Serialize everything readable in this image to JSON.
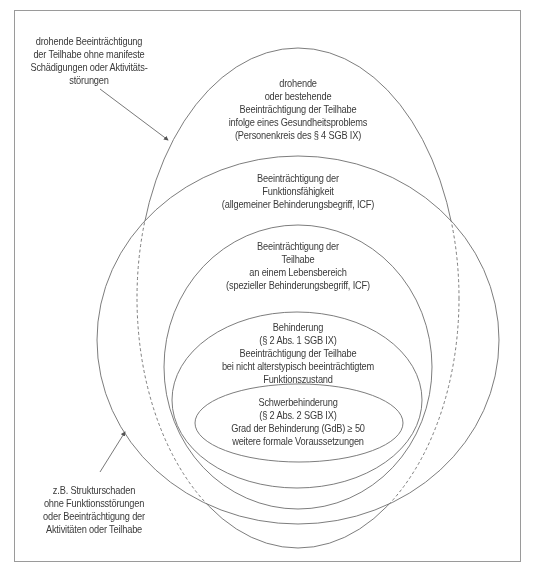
{
  "diagram": {
    "type": "nested-ellipses",
    "colors": {
      "line": "#6e6e6e",
      "text": "#3a3a3a",
      "frame": "#9a9a9a",
      "background": "#ffffff"
    }
  },
  "annotations": {
    "top_left": {
      "lines": [
        "drohende Beeinträchtigung",
        "der Teilhabe ohne manifeste",
        "Schädigungen oder Aktivitäts-",
        "störungen"
      ]
    },
    "bottom_left": {
      "lines": [
        "z.B. Strukturschaden",
        "ohne Funktionsstörungen",
        "oder Beeinträchtigung der",
        "Aktivitäten oder Teilhabe"
      ]
    }
  },
  "ellipses": [
    {
      "id": "personenkreis",
      "lines": [
        "drohende",
        "oder bestehende",
        "Beeinträchtigung der Teilhabe",
        "infolge eines Gesundheitsproblems",
        "(Personenkreis des § 4 SGB IX)"
      ]
    },
    {
      "id": "funktionsfaehigkeit",
      "lines": [
        "Beeinträchtigung der",
        "Funktionsfähigkeit",
        "(allgemeiner  Behinderungsbegriff, ICF)"
      ]
    },
    {
      "id": "teilhabe-lebensbereich",
      "lines": [
        "Beeinträchtigung der",
        "Teilhabe",
        "an einem Lebensbereich",
        "(spezieller Behinderungsbegriff, ICF)"
      ]
    },
    {
      "id": "behinderung",
      "lines": [
        "Behinderung",
        "(§ 2 Abs. 1 SGB IX)",
        "Beeinträchtigung der Teilhabe",
        "bei nicht alterstypisch beeinträchtigtem",
        "Funktionszustand"
      ]
    },
    {
      "id": "schwerbehinderung",
      "lines": [
        "Schwerbehinderung",
        "(§ 2 Abs. 2 SGB IX)",
        "Grad der Behinderung (GdB) ≥ 50",
        "weitere formale Voraussetzungen"
      ]
    }
  ]
}
